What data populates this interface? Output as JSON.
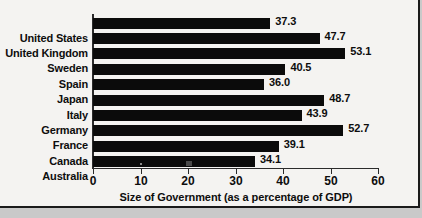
{
  "chart_data": {
    "type": "bar",
    "orientation": "horizontal",
    "title": "",
    "xlabel": "Size of Government (as a percentage of GDP)",
    "ylabel": "",
    "xlim": [
      0,
      60
    ],
    "xticks": [
      0,
      10,
      20,
      30,
      40,
      50,
      60
    ],
    "grid": false,
    "legend": false,
    "categories": [
      "United States",
      "United Kingdom",
      "Sweden",
      "Spain",
      "Japan",
      "Italy",
      "Germany",
      "France",
      "Canada",
      "Australia"
    ],
    "values": [
      37.3,
      47.7,
      53.1,
      40.5,
      36.0,
      48.7,
      43.9,
      52.7,
      39.1,
      34.1
    ],
    "value_labels": [
      "37.3",
      "47.7",
      "53.1",
      "40.5",
      "36.0",
      "48.7",
      "43.9",
      "52.7",
      "39.1",
      "34.1"
    ],
    "bar_color": "#0b0b0b",
    "background_color": "#f4f3f1",
    "axis_color": "#2b2b2b"
  }
}
